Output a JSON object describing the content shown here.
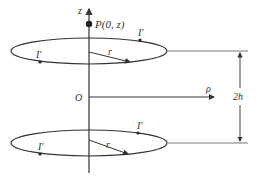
{
  "diagram": {
    "type": "two coaxial current loops",
    "axis_labels": {
      "z": "z",
      "rho": "ρ",
      "origin": "O"
    },
    "point": {
      "label": "P(0, z)",
      "name": "P",
      "coords": "(0, z)"
    },
    "loops": [
      {
        "name": "top-loop",
        "current_labels": [
          "I'",
          "I'"
        ],
        "radius_label": "r"
      },
      {
        "name": "bottom-loop",
        "current_labels": [
          "I'",
          "I'"
        ],
        "radius_label": "r"
      }
    ],
    "separation_label": "2h",
    "colors": {
      "stroke": "#333333",
      "background": "#ffffff"
    }
  }
}
